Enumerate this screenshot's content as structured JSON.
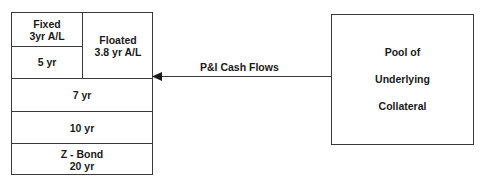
{
  "tranches": {
    "fixed": {
      "line1": "Fixed",
      "line2": "3yr A/L"
    },
    "floated": {
      "line1": "Floated",
      "line2": "3.8 yr A/L"
    },
    "five": {
      "label": "5 yr"
    },
    "seven": {
      "label": "7 yr"
    },
    "ten": {
      "label": "10 yr"
    },
    "zbond": {
      "line1": "Z - Bond",
      "line2": "20 yr"
    }
  },
  "arrow": {
    "label": "P&I Cash Flows"
  },
  "pool": {
    "line1": "Pool of",
    "line2": "Underlying",
    "line3": "Collateral"
  }
}
